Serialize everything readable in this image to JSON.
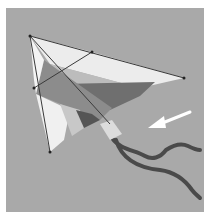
{
  "image": {
    "subject": "delta kite with two tails",
    "annotation": "white arrow pointing toward kite tail attachment",
    "colors": {
      "border": "#ffffff",
      "sky": "#a9a9a9",
      "sail_light": "#ececec",
      "sail_mid": "#bcbcbc",
      "sail_dark": "#6f6f6f",
      "sail_darker": "#555555",
      "tail": "#4a4a4a",
      "arrow": "#ffffff",
      "spar": "#3a3a3a"
    }
  }
}
